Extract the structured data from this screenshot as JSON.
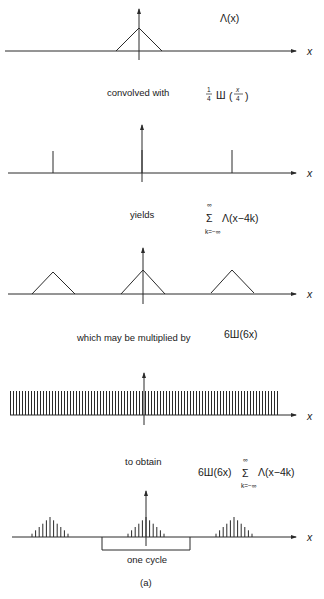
{
  "figure": {
    "caption": "(a)",
    "axis_label": "x",
    "panels": [
      {
        "id": "triangle",
        "label": "Λ(x)"
      },
      {
        "id": "comb4",
        "connector": "convolved with",
        "label_coef": "1",
        "label_den": "4",
        "label_sha": "Ш",
        "label_arg_num": "x",
        "label_arg_den": "4"
      },
      {
        "id": "periodic-triangles",
        "connector": "yields",
        "sum_upper": "∞",
        "sum_lower": "k=−∞",
        "sum_symbol": "Σ",
        "sum_term": "Λ(x−4k)"
      },
      {
        "id": "comb6",
        "connector": "which may be multiplied by",
        "label": "6Ш(6x)"
      },
      {
        "id": "sampled",
        "connector": "to obtain",
        "label_prefix": "6Ш(6x)",
        "sum_upper": "∞",
        "sum_lower": "k=−∞",
        "sum_symbol": "Σ",
        "sum_term": "Λ(x−4k)",
        "bracket_label": "one cycle"
      }
    ]
  },
  "chart_data": {
    "type": "diagram",
    "panels": [
      {
        "expression": "Λ(x)",
        "kind": "triangle",
        "center": 0,
        "half_width": 1,
        "height": 1
      },
      {
        "expression": "(1/4) Ш(x/4)",
        "kind": "impulse-train",
        "period": 4,
        "impulse_positions": [
          -4,
          0,
          4
        ]
      },
      {
        "expression": "Σ Λ(x−4k), k=−∞..∞",
        "kind": "periodic-triangle",
        "period": 4,
        "centers": [
          -4,
          0,
          4
        ]
      },
      {
        "expression": "6Ш(6x)",
        "kind": "impulse-train",
        "period": 0.1667
      },
      {
        "expression": "6Ш(6x) Σ Λ(x−4k)",
        "kind": "sampled-periodic-triangle",
        "period": 4,
        "samples_per_triangle": 11,
        "annotation": "one cycle"
      }
    ]
  }
}
